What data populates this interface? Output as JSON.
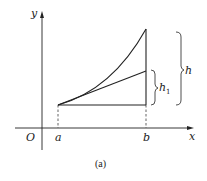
{
  "diagram": {
    "caption": "(a)",
    "axes": {
      "x_label": "x",
      "y_label": "y",
      "origin_label": "O"
    },
    "points": {
      "a_label": "a",
      "b_label": "b"
    },
    "braces": {
      "h_label": "h",
      "h1_label": "h",
      "h1_subscript": "1"
    },
    "colors": {
      "stroke": "#222222",
      "background": "#ffffff"
    }
  }
}
